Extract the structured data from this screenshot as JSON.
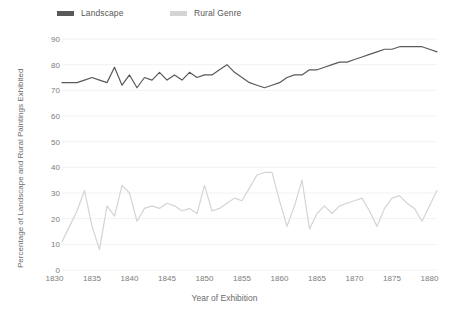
{
  "legend": {
    "position": "top-left",
    "items": [
      {
        "label": "Landscape",
        "color": "#595959"
      },
      {
        "label": "Rural Genre",
        "color": "#d4d4d4"
      }
    ]
  },
  "axes": {
    "ylabel": "Percentage of Landscape and Rural Paintings Exhibited",
    "xlabel": "Year of Exhibition",
    "yticks": [
      0,
      10,
      20,
      30,
      40,
      50,
      60,
      70,
      80,
      90
    ],
    "xticks": [
      1830,
      1835,
      1840,
      1845,
      1850,
      1855,
      1860,
      1865,
      1870,
      1875,
      1880
    ]
  },
  "chart_data": {
    "type": "line",
    "title": "",
    "xlabel": "Year of Exhibition",
    "ylabel": "Percentage of Landscape and Rural Paintings Exhibited",
    "xlim": [
      1831,
      1881
    ],
    "ylim": [
      0,
      90
    ],
    "grid": true,
    "legend_position": "top-left",
    "x": [
      1831,
      1832,
      1833,
      1834,
      1835,
      1836,
      1837,
      1838,
      1839,
      1840,
      1841,
      1842,
      1843,
      1844,
      1845,
      1846,
      1847,
      1848,
      1849,
      1850,
      1851,
      1852,
      1853,
      1854,
      1855,
      1856,
      1857,
      1858,
      1859,
      1860,
      1861,
      1862,
      1863,
      1864,
      1865,
      1866,
      1867,
      1868,
      1869,
      1870,
      1871,
      1872,
      1873,
      1874,
      1875,
      1876,
      1877,
      1878,
      1879,
      1880,
      1881
    ],
    "series": [
      {
        "name": "Landscape",
        "color": "#595959",
        "values": [
          73,
          73,
          73,
          74,
          75,
          74,
          73,
          79,
          72,
          76,
          71,
          75,
          74,
          77,
          74,
          76,
          74,
          77,
          75,
          76,
          76,
          78,
          80,
          77,
          75,
          73,
          72,
          71,
          72,
          73,
          75,
          76,
          76,
          78,
          78,
          79,
          80,
          81,
          81,
          82,
          83,
          84,
          85,
          86,
          86,
          87,
          87,
          87,
          87,
          86,
          85
        ]
      },
      {
        "name": "Rural Genre",
        "color": "#d4d4d4",
        "values": [
          11,
          17,
          23,
          31,
          17,
          8,
          25,
          21,
          33,
          30,
          19,
          24,
          25,
          24,
          26,
          25,
          23,
          24,
          22,
          33,
          23,
          24,
          26,
          28,
          27,
          32,
          37,
          38,
          38,
          27,
          17,
          25,
          35,
          16,
          22,
          25,
          22,
          25,
          26,
          27,
          28,
          23,
          17,
          24,
          28,
          29,
          26,
          24,
          19,
          25,
          31
        ]
      }
    ]
  }
}
